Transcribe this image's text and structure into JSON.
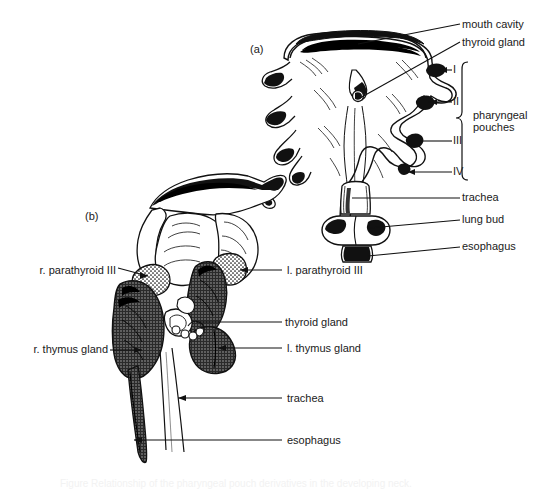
{
  "figure": {
    "caption": "Figure  Relationship of the pharyngeal pouch derivatives in the developing neck.",
    "panels": [
      {
        "id": "a",
        "tag": "(a)",
        "description": "ventral view of pharynx, pharyngeal pouches, trachea, lung bud and esophagus"
      },
      {
        "id": "b",
        "tag": "(b)",
        "description": "lateral view showing descent of thymus and parathyroid glands alongside thyroid, trachea and esophagus"
      }
    ]
  },
  "panel_a": {
    "tag": "(a)",
    "labels": [
      {
        "key": "mouth_cavity",
        "text": "mouth cavity"
      },
      {
        "key": "thyroid_gland",
        "text": "thyroid gland"
      },
      {
        "key": "pharyngeal_pouches",
        "text": "pharyngeal\npouches"
      },
      {
        "key": "trachea",
        "text": "trachea"
      },
      {
        "key": "lung_bud",
        "text": "lung bud"
      },
      {
        "key": "esophagus",
        "text": "esophagus"
      }
    ],
    "pouch_numerals": [
      {
        "key": "pouch_1",
        "text": "I"
      },
      {
        "key": "pouch_2",
        "text": "II"
      },
      {
        "key": "pouch_3",
        "text": "III"
      },
      {
        "key": "pouch_4",
        "text": "IV"
      }
    ]
  },
  "panel_b": {
    "tag": "(b)",
    "labels_left": [
      {
        "key": "r_parathyroid_iii",
        "text": "r. parathyroid III"
      },
      {
        "key": "r_thymus_gland",
        "text": "r. thymus gland"
      }
    ],
    "labels_right": [
      {
        "key": "l_parathyroid_iii",
        "text": "l. parathyroid III"
      },
      {
        "key": "thyroid_gland",
        "text": "thyroid gland"
      },
      {
        "key": "l_thymus_gland",
        "text": "l. thymus gland"
      },
      {
        "key": "trachea",
        "text": "trachea"
      },
      {
        "key": "esophagus",
        "text": "esophagus"
      }
    ]
  },
  "colors": {
    "ink": "#1a1a1a",
    "background": "#ffffff",
    "thymus_fill": "#5a5a5a",
    "solid_black": "#000000",
    "stipple": "#ffffff"
  }
}
